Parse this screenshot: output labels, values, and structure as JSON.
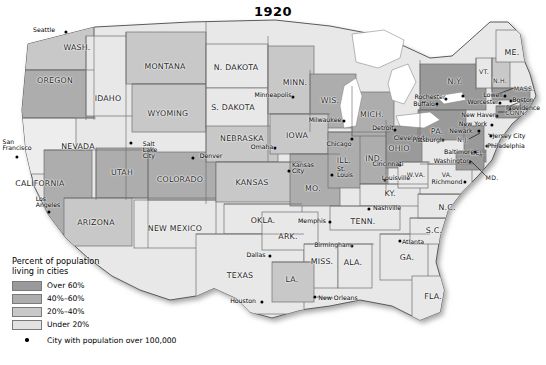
{
  "title": "1920",
  "legend": {
    "title_line1": "Percent of population",
    "title_line2": "living in cities",
    "classes": [
      {
        "label": "Over 60%",
        "color": "#9a9a9a"
      },
      {
        "label": "40%–60%",
        "color": "#adadad"
      },
      {
        "label": "20%–40%",
        "color": "#c8c8c8"
      },
      {
        "label": "Under 20%",
        "color": "#e2e2e2"
      }
    ],
    "city_note": "City with population over 100,000",
    "city_marker": "city-dot-icon"
  },
  "palette": {
    "over60": "#9a9a9a",
    "p40_60": "#adadad",
    "p20_40": "#c8c8c8",
    "under20": "#e8e8e8",
    "border": "#6e6e6e",
    "coast": "#555555",
    "water": "#ffffff",
    "shadow": "#bdbdbd"
  },
  "states": [
    {
      "name": "WASH.",
      "label": "WASH.",
      "x": 77,
      "y": 47,
      "cls": "p20_40",
      "size": "big"
    },
    {
      "name": "OREGON",
      "label": "OREGON",
      "x": 55,
      "y": 80,
      "cls": "p40_60",
      "size": "big"
    },
    {
      "name": "IDAHO",
      "label": "IDAHO",
      "x": 108,
      "y": 98,
      "cls": "under20",
      "size": "big"
    },
    {
      "name": "MONTANA",
      "label": "MONTANA",
      "x": 165,
      "y": 66,
      "cls": "p20_40",
      "size": "big"
    },
    {
      "name": "WYOMING",
      "label": "WYOMING",
      "x": 168,
      "y": 113,
      "cls": "p20_40",
      "size": "big"
    },
    {
      "name": "N. DAKOTA",
      "label": "N. DAKOTA",
      "x": 236,
      "y": 67,
      "cls": "under20",
      "size": "big"
    },
    {
      "name": "S. DAKOTA",
      "label": "S. DAKOTA",
      "x": 233,
      "y": 107,
      "cls": "under20",
      "size": "big"
    },
    {
      "name": "NEBRASKA",
      "label": "NEBRASKA",
      "x": 242,
      "y": 138,
      "cls": "p20_40",
      "size": "big"
    },
    {
      "name": "MINN.",
      "label": "MINN.",
      "x": 295,
      "y": 82,
      "cls": "p20_40",
      "size": "big"
    },
    {
      "name": "WIS.",
      "label": "WIS.",
      "x": 330,
      "y": 100,
      "cls": "p40_60",
      "size": "big"
    },
    {
      "name": "IOWA",
      "label": "IOWA",
      "x": 297,
      "y": 135,
      "cls": "p20_40",
      "size": "big"
    },
    {
      "name": "MICH.",
      "label": "MICH.",
      "x": 372,
      "y": 114,
      "cls": "p40_60",
      "size": "big"
    },
    {
      "name": "ILL.",
      "label": "ILL.",
      "x": 344,
      "y": 160,
      "cls": "p40_60",
      "size": "big"
    },
    {
      "name": "IND.",
      "label": "IND.",
      "x": 374,
      "y": 158,
      "cls": "p40_60",
      "size": "big"
    },
    {
      "name": "OHIO",
      "label": "OHIO",
      "x": 399,
      "y": 148,
      "cls": "over60",
      "size": "big"
    },
    {
      "name": "NEVADA",
      "label": "NEVADA",
      "x": 78,
      "y": 146,
      "cls": "under20",
      "size": "big"
    },
    {
      "name": "UTAH",
      "label": "UTAH",
      "x": 122,
      "y": 172,
      "cls": "p40_60",
      "size": "big"
    },
    {
      "name": "COLORADO",
      "label": "COLORADO",
      "x": 180,
      "y": 179,
      "cls": "p40_60",
      "size": "big"
    },
    {
      "name": "KANSAS",
      "label": "KANSAS",
      "x": 252,
      "y": 182,
      "cls": "p20_40",
      "size": "big"
    },
    {
      "name": "MO.",
      "label": "MO.",
      "x": 313,
      "y": 188,
      "cls": "p40_60",
      "size": "big"
    },
    {
      "name": "KY.",
      "label": "KY.",
      "x": 390,
      "y": 193,
      "cls": "under20",
      "size": "big"
    },
    {
      "name": "CALIFORNIA",
      "label": "CALIFORNIA",
      "x": 40,
      "y": 183,
      "cls": "p40_60",
      "size": "big"
    },
    {
      "name": "ARIZONA",
      "label": "ARIZONA",
      "x": 96,
      "y": 222,
      "cls": "p20_40",
      "size": "big"
    },
    {
      "name": "NEW MEXICO",
      "label": "NEW MEXICO",
      "x": 175,
      "y": 228,
      "cls": "under20",
      "size": "big"
    },
    {
      "name": "OKLA.",
      "label": "OKLA.",
      "x": 263,
      "y": 220,
      "cls": "under20",
      "size": "big"
    },
    {
      "name": "ARK.",
      "label": "ARK.",
      "x": 288,
      "y": 236,
      "cls": "under20",
      "size": "big"
    },
    {
      "name": "TENN.",
      "label": "TENN.",
      "x": 363,
      "y": 221,
      "cls": "under20",
      "size": "big"
    },
    {
      "name": "N.C.",
      "label": "N.C.",
      "x": 447,
      "y": 207,
      "cls": "under20",
      "size": "big"
    },
    {
      "name": "S.C.",
      "label": "S.C.",
      "x": 434,
      "y": 230,
      "cls": "under20",
      "size": "big"
    },
    {
      "name": "MISS.",
      "label": "MISS.",
      "x": 322,
      "y": 261,
      "cls": "under20",
      "size": "big"
    },
    {
      "name": "ALA.",
      "label": "ALA.",
      "x": 353,
      "y": 262,
      "cls": "under20",
      "size": "big"
    },
    {
      "name": "GA.",
      "label": "GA.",
      "x": 407,
      "y": 257,
      "cls": "under20",
      "size": "big"
    },
    {
      "name": "TEXAS",
      "label": "TEXAS",
      "x": 240,
      "y": 275,
      "cls": "under20",
      "size": "big"
    },
    {
      "name": "LA.",
      "label": "LA.",
      "x": 292,
      "y": 279,
      "cls": "p20_40",
      "size": "big"
    },
    {
      "name": "FLA.",
      "label": "FLA.",
      "x": 433,
      "y": 296,
      "cls": "under20",
      "size": "big"
    },
    {
      "name": "N.Y.",
      "label": "N.Y.",
      "x": 455,
      "y": 81,
      "cls": "over60",
      "size": "big"
    },
    {
      "name": "VT.",
      "label": "VT.",
      "x": 484,
      "y": 71,
      "cls": "under20",
      "size": "sm"
    },
    {
      "name": "N.H.",
      "label": "N.H.",
      "x": 500,
      "y": 80,
      "cls": "p20_40",
      "size": "sm"
    },
    {
      "name": "ME.",
      "label": "ME.",
      "x": 512,
      "y": 52,
      "cls": "under20",
      "size": "big"
    },
    {
      "name": "MASS.",
      "label": "MASS.",
      "x": 524,
      "y": 88,
      "cls": "over60",
      "size": "sm"
    },
    {
      "name": "CONN.",
      "label": "CONN.",
      "x": 516,
      "y": 112,
      "cls": "over60",
      "size": "sm"
    },
    {
      "name": "R.I.",
      "label": "R.I.",
      "x": 528,
      "y": 102,
      "cls": "over60",
      "size": "xs"
    },
    {
      "name": "PA.",
      "label": "PA.",
      "x": 437,
      "y": 131,
      "cls": "over60",
      "size": "big"
    },
    {
      "name": "N.J.",
      "label": "N.J.",
      "x": 463,
      "y": 139,
      "cls": "over60",
      "size": "sm"
    },
    {
      "name": "DEL.",
      "label": "DEL.",
      "x": 478,
      "y": 152,
      "cls": "over60",
      "size": "sm"
    },
    {
      "name": "MD.",
      "label": "MD.",
      "x": 492,
      "y": 177,
      "cls": "over60",
      "size": "sm"
    },
    {
      "name": "W.VA.",
      "label": "W.VA.",
      "x": 416,
      "y": 174,
      "cls": "under20",
      "size": "sm"
    },
    {
      "name": "VA.",
      "label": "VA.",
      "x": 447,
      "y": 174,
      "cls": "under20",
      "size": "sm"
    }
  ],
  "cities": [
    {
      "name": "Seattle",
      "dx": 66,
      "dy": 32,
      "lx": 44,
      "ly": 30,
      "lines": [
        "Seattle"
      ]
    },
    {
      "name": "San Francisco",
      "dx": 17,
      "dy": 157,
      "lx": 17,
      "ly": 145,
      "lines": [
        "San",
        "Francisco"
      ]
    },
    {
      "name": "Los Angeles",
      "dx": 49,
      "dy": 212,
      "lx": 48,
      "ly": 202,
      "lines": [
        "Los",
        "Angeles"
      ]
    },
    {
      "name": "Salt Lake City",
      "dx": 131,
      "dy": 143,
      "lx": 150,
      "ly": 150,
      "lines": [
        "Salt",
        "Lake",
        "City"
      ]
    },
    {
      "name": "Denver",
      "dx": 193,
      "dy": 158,
      "lx": 211,
      "ly": 156,
      "lines": [
        "Denver"
      ]
    },
    {
      "name": "Minneapolis",
      "dx": 293,
      "dy": 97,
      "lx": 273,
      "ly": 95,
      "lines": [
        "Minneapolis"
      ]
    },
    {
      "name": "Milwaukee",
      "dx": 344,
      "dy": 121,
      "lx": 325,
      "ly": 120,
      "lines": [
        "Milwaukee"
      ]
    },
    {
      "name": "Chicago",
      "dx": 352,
      "dy": 139,
      "lx": 339,
      "ly": 144,
      "lines": [
        "Chicago"
      ]
    },
    {
      "name": "Omaha",
      "dx": 275,
      "dy": 148,
      "lx": 262,
      "ly": 147,
      "lines": [
        "Omaha"
      ]
    },
    {
      "name": "Kansas City",
      "dx": 289,
      "dy": 171,
      "lx": 303,
      "ly": 168,
      "lines": [
        "Kansas",
        "City"
      ]
    },
    {
      "name": "St. Louis",
      "dx": 332,
      "dy": 175,
      "lx": 345,
      "ly": 172,
      "lines": [
        "St.",
        "Louis"
      ]
    },
    {
      "name": "Detroit",
      "dx": 395,
      "dy": 130,
      "lx": 383,
      "ly": 128,
      "lines": [
        "Detroit"
      ]
    },
    {
      "name": "Cleveland",
      "dx": 420,
      "dy": 140,
      "lx": 409,
      "ly": 138,
      "lines": [
        "Cleveland"
      ]
    },
    {
      "name": "Cincinnati",
      "dx": 400,
      "dy": 165,
      "lx": 388,
      "ly": 164,
      "lines": [
        "Cincinnati"
      ]
    },
    {
      "name": "Louisville",
      "dx": 385,
      "dy": 180,
      "lx": 396,
      "ly": 178,
      "lines": [
        "Louisville"
      ]
    },
    {
      "name": "Rochester",
      "dx": 446,
      "dy": 99,
      "lx": 430,
      "ly": 97,
      "lines": [
        "Rochester"
      ]
    },
    {
      "name": "Buffalo",
      "dx": 437,
      "dy": 104,
      "lx": 424,
      "ly": 104,
      "lines": [
        "Buffalo"
      ]
    },
    {
      "name": "Syracuse",
      "dx": 463,
      "dy": 96,
      "lx": 463,
      "ly": 96,
      "lines": [
        ""
      ]
    },
    {
      "name": "Worcester",
      "dx": 500,
      "dy": 103,
      "lx": 483,
      "ly": 102,
      "lines": [
        "Worcester"
      ]
    },
    {
      "name": "Lowell",
      "dx": 505,
      "dy": 96,
      "lx": 493,
      "ly": 95,
      "lines": [
        "Lowell"
      ]
    },
    {
      "name": "Boston",
      "dx": 511,
      "dy": 101,
      "lx": 523,
      "ly": 100,
      "lines": [
        "Boston"
      ]
    },
    {
      "name": "Providence",
      "dx": 510,
      "dy": 109,
      "lx": 523,
      "ly": 108,
      "lines": [
        "Providence"
      ]
    },
    {
      "name": "New Haven",
      "dx": 497,
      "dy": 116,
      "lx": 479,
      "ly": 115,
      "lines": [
        "New Haven"
      ]
    },
    {
      "name": "New York",
      "dx": 492,
      "dy": 125,
      "lx": 473,
      "ly": 124,
      "lines": [
        "New York"
      ]
    },
    {
      "name": "Newark",
      "dx": 479,
      "dy": 131,
      "lx": 461,
      "ly": 131,
      "lines": [
        "Newark"
      ]
    },
    {
      "name": "Jersey City",
      "dx": 491,
      "dy": 136,
      "lx": 509,
      "ly": 136,
      "lines": [
        "Jersey City"
      ]
    },
    {
      "name": "Philadelphia",
      "dx": 487,
      "dy": 146,
      "lx": 506,
      "ly": 146,
      "lines": [
        "Philadelphia"
      ]
    },
    {
      "name": "Pittsburgh",
      "dx": 443,
      "dy": 140,
      "lx": 428,
      "ly": 140,
      "lines": [
        "Pittsburgh"
      ]
    },
    {
      "name": "Baltimore",
      "dx": 475,
      "dy": 152,
      "lx": 459,
      "ly": 152,
      "lines": [
        "Baltimore"
      ]
    },
    {
      "name": "Washington",
      "dx": 470,
      "dy": 162,
      "lx": 452,
      "ly": 161,
      "lines": [
        "Washington"
      ]
    },
    {
      "name": "Richmond",
      "dx": 465,
      "dy": 182,
      "lx": 447,
      "ly": 182,
      "lines": [
        "Richmond"
      ]
    },
    {
      "name": "Nashville",
      "dx": 369,
      "dy": 209,
      "lx": 387,
      "ly": 208,
      "lines": [
        "Nashville"
      ]
    },
    {
      "name": "Memphis",
      "dx": 330,
      "dy": 222,
      "lx": 312,
      "ly": 221,
      "lines": [
        "Memphis"
      ]
    },
    {
      "name": "Birmingham",
      "dx": 352,
      "dy": 246,
      "lx": 333,
      "ly": 245,
      "lines": [
        "Birmingham"
      ]
    },
    {
      "name": "Atlanta",
      "dx": 400,
      "dy": 241,
      "lx": 413,
      "ly": 242,
      "lines": [
        "Atlanta"
      ]
    },
    {
      "name": "Dallas",
      "dx": 270,
      "dy": 256,
      "lx": 256,
      "ly": 255,
      "lines": [
        "Dallas"
      ]
    },
    {
      "name": "Houston",
      "dx": 262,
      "dy": 302,
      "lx": 243,
      "ly": 301,
      "lines": [
        "Houston"
      ]
    },
    {
      "name": "New Orleans",
      "dx": 315,
      "dy": 297,
      "lx": 338,
      "ly": 298,
      "lines": [
        "New Orleans"
      ]
    }
  ]
}
